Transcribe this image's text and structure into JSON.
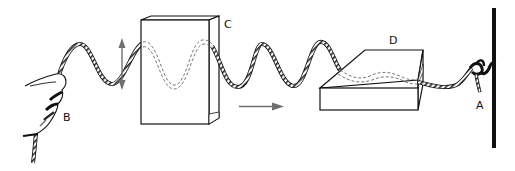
{
  "diagram": {
    "type": "illustration",
    "labels": {
      "A": "A",
      "B": "B",
      "C": "C",
      "D": "D"
    },
    "elements": [
      {
        "id": "hand",
        "label": "B",
        "description": "hand shaking rope end"
      },
      {
        "id": "vertical-slit-box",
        "label": "C",
        "description": "upright box with vertical slit"
      },
      {
        "id": "horizontal-slit-box",
        "label": "D",
        "description": "flat box with horizontal slit"
      },
      {
        "id": "wall-anchor",
        "label": "A",
        "description": "rope tied to wall"
      }
    ],
    "arrows": [
      {
        "id": "oscillation-arrow",
        "direction": "vertical-double"
      },
      {
        "id": "propagation-arrow",
        "direction": "right"
      }
    ],
    "colors": {
      "line": "#111111",
      "arrow": "#707070",
      "background": "#ffffff"
    }
  }
}
